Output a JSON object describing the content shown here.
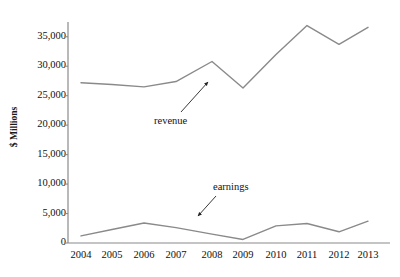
{
  "chart_data": {
    "type": "line",
    "title": "",
    "xlabel": "",
    "ylabel": "$ Millions",
    "categories": [
      "2004",
      "2005",
      "2006",
      "2007",
      "2008",
      "2009",
      "2010",
      "2011",
      "2012",
      "2013"
    ],
    "ylim": [
      0,
      37500
    ],
    "yticks": [
      0,
      5000,
      10000,
      15000,
      20000,
      25000,
      30000,
      35000
    ],
    "ytick_labels": [
      "0",
      "5,000",
      "10,000",
      "15,000",
      "20,000",
      "25,000",
      "30,000",
      "35,000"
    ],
    "grid": false,
    "legend": "annotations-with-arrows",
    "series": [
      {
        "name": "revenue",
        "color": "#8a8a8a",
        "values": [
          27200,
          26900,
          26500,
          27400,
          30800,
          26300,
          32000,
          36900,
          33700,
          36600
        ]
      },
      {
        "name": "earnings",
        "color": "#8a8a8a",
        "values": [
          1200,
          2300,
          3400,
          2600,
          1500,
          600,
          2900,
          3300,
          1900,
          3700
        ]
      }
    ],
    "annotations": [
      {
        "text": "revenue",
        "series": "revenue",
        "points_to_year": "2008"
      },
      {
        "text": "earnings",
        "series": "earnings",
        "points_to_year": "2007"
      }
    ],
    "axis_color": "#8a8a8a",
    "line_color": "#8a8a8a",
    "background": "#ffffff"
  },
  "geometry": {
    "plot_left": 68,
    "plot_right": 390,
    "y_zero_px": 243,
    "y_top_px": 22,
    "y_top_value": 37500,
    "x_positions": [
      81,
      112,
      144,
      176,
      212,
      243,
      276,
      307,
      339,
      368
    ],
    "ytick_px": [
      243,
      212,
      185,
      158,
      130,
      103,
      76,
      49
    ],
    "annotation_arrows": [
      {
        "name": "revenue-arrow",
        "x1": 181,
        "y1": 112,
        "x2": 208,
        "y2": 82
      },
      {
        "name": "earnings-arrow",
        "x1": 216,
        "y1": 196,
        "x2": 198,
        "y2": 216
      }
    ]
  }
}
